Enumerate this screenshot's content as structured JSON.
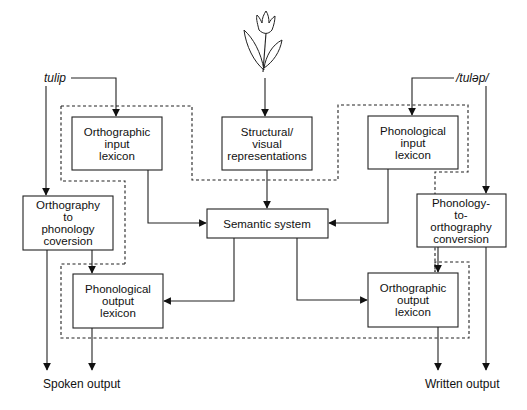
{
  "diagram": {
    "type": "cognitive-neuropsychological model of word processing",
    "inputs": {
      "written_word": "tulip",
      "spoken_word": "/tulǝp/",
      "picture": "tulip-drawing"
    },
    "boxes": {
      "orthographic_input_lexicon": [
        "Orthographic",
        "input",
        "lexicon"
      ],
      "structural_visual": [
        "Structural/",
        "visual",
        "representations"
      ],
      "phonological_input_lexicon": [
        "Phonological",
        "input",
        "lexicon"
      ],
      "orthography_to_phonology": [
        "Orthography",
        "to",
        "phonology",
        "coversion"
      ],
      "semantic_system": [
        "Semantic system"
      ],
      "phonology_to_orthography": [
        "Phonology-",
        "to-",
        "orthography",
        "conversion"
      ],
      "phonological_output_lexicon": [
        "Phonological",
        "output",
        "lexicon"
      ],
      "orthographic_output_lexicon": [
        "Orthographic",
        "output",
        "lexicon"
      ]
    },
    "outputs": {
      "spoken": "Spoken output",
      "written": "Written output"
    },
    "connections": [
      {
        "from": "tulip",
        "to": "Orthographic input lexicon"
      },
      {
        "from": "tulip",
        "to": "Orthography to phonology coversion"
      },
      {
        "from": "picture",
        "to": "Structural/visual representations"
      },
      {
        "from": "/tulǝp/",
        "to": "Phonological input lexicon"
      },
      {
        "from": "/tulǝp/",
        "to": "Phonology-to-orthography conversion"
      },
      {
        "from": "Orthographic input lexicon",
        "to": "Semantic system"
      },
      {
        "from": "Structural/visual representations",
        "to": "Semantic system"
      },
      {
        "from": "Phonological input lexicon",
        "to": "Semantic system"
      },
      {
        "from": "Semantic system",
        "to": "Phonological output lexicon"
      },
      {
        "from": "Semantic system",
        "to": "Orthographic output lexicon"
      },
      {
        "from": "Orthography to phonology coversion",
        "to": "Phonological output lexicon"
      },
      {
        "from": "Orthography to phonology coversion",
        "to": "Spoken output"
      },
      {
        "from": "Phonological output lexicon",
        "to": "Spoken output"
      },
      {
        "from": "Phonology-to-orthography conversion",
        "to": "Orthographic output lexicon"
      },
      {
        "from": "Phonology-to-orthography conversion",
        "to": "Written output"
      },
      {
        "from": "Orthographic output lexicon",
        "to": "Written output"
      }
    ],
    "regions": [
      "input-lexicons-dashed-region",
      "output-lexicons-dashed-region"
    ]
  }
}
